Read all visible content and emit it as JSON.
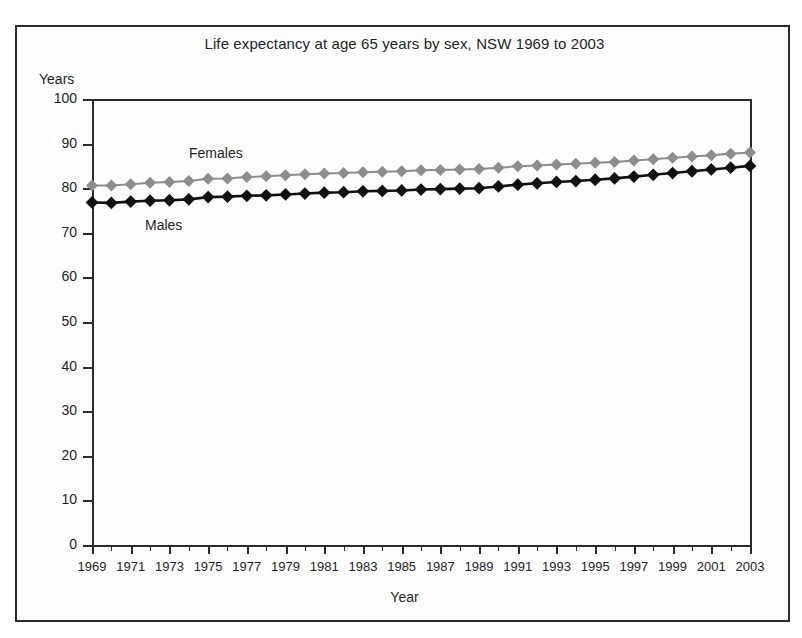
{
  "chart_data": {
    "type": "line",
    "title": "Life expectancy at age 65 years by sex, NSW 1969 to 2003",
    "xlabel": "Year",
    "ylabel": "Years",
    "ylim": [
      0,
      100
    ],
    "xlim": [
      1969,
      2003
    ],
    "ytick_step": 10,
    "grid": false,
    "legend_position": "inline-annotation",
    "yticks": [
      "0",
      "10",
      "20",
      "30",
      "40",
      "50",
      "60",
      "70",
      "80",
      "90",
      "100"
    ],
    "x": [
      1969,
      1970,
      1971,
      1972,
      1973,
      1974,
      1975,
      1976,
      1977,
      1978,
      1979,
      1980,
      1981,
      1982,
      1983,
      1984,
      1985,
      1986,
      1987,
      1988,
      1989,
      1990,
      1991,
      1992,
      1993,
      1994,
      1995,
      1996,
      1997,
      1998,
      1999,
      2000,
      2001,
      2002,
      2003
    ],
    "xtick_labels": [
      "1969",
      "1971",
      "1973",
      "1975",
      "1977",
      "1979",
      "1981",
      "1983",
      "1985",
      "1987",
      "1989",
      "1991",
      "1993",
      "1995",
      "1997",
      "1999",
      "2001",
      "2003"
    ],
    "series": [
      {
        "name": "Females",
        "color": "#8d8d8d",
        "marker": "diamond",
        "values": [
          80.6,
          80.6,
          80.9,
          81.2,
          81.4,
          81.6,
          82.1,
          82.2,
          82.5,
          82.7,
          82.9,
          83.1,
          83.3,
          83.4,
          83.6,
          83.7,
          83.8,
          84.0,
          84.1,
          84.2,
          84.3,
          84.6,
          84.9,
          85.1,
          85.3,
          85.5,
          85.7,
          85.9,
          86.2,
          86.5,
          86.8,
          87.1,
          87.4,
          87.7,
          88.0
        ]
      },
      {
        "name": "Males",
        "color": "#111111",
        "marker": "diamond",
        "values": [
          76.8,
          76.7,
          77.0,
          77.2,
          77.3,
          77.5,
          78.0,
          78.1,
          78.3,
          78.4,
          78.6,
          78.8,
          79.0,
          79.1,
          79.3,
          79.4,
          79.5,
          79.7,
          79.8,
          79.9,
          80.0,
          80.4,
          80.8,
          81.1,
          81.4,
          81.6,
          81.9,
          82.2,
          82.6,
          83.0,
          83.4,
          83.8,
          84.2,
          84.6,
          85.0
        ]
      }
    ],
    "annotations": [
      {
        "text": "Females",
        "series": "Females"
      },
      {
        "text": "Males",
        "series": "Males"
      }
    ]
  }
}
